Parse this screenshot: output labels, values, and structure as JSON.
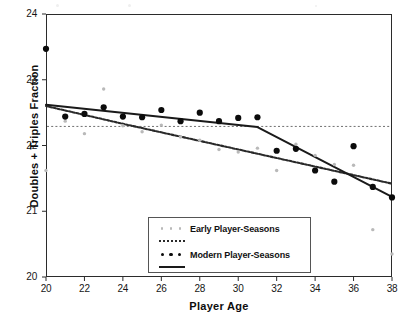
{
  "figure": {
    "background": "#ffffff",
    "frame_color": "#2b2b2b"
  },
  "axes": {
    "xlabel": "Player  Age",
    "ylabel": "Doubles  +  Triples  Fraction",
    "xlim": [
      20,
      38
    ],
    "ylim": [
      20,
      24
    ],
    "xticks": [
      20,
      22,
      24,
      26,
      28,
      30,
      32,
      34,
      36,
      38
    ],
    "yticks": [
      20,
      21,
      22,
      23,
      24
    ],
    "xtick_labels": [
      "20",
      "22",
      "24",
      "26",
      "28",
      "30",
      "32",
      "34",
      "36",
      "38"
    ],
    "ytick_labels": [
      "20",
      "21",
      "22",
      "23",
      "24"
    ],
    "grid": false
  },
  "legend": {
    "position": "lower-center-inside",
    "entries": [
      {
        "label": "Early Player-Seasons",
        "marker_color": "#b9b9b9",
        "line_style": "dotted",
        "line_color": "#2a2a2a"
      },
      {
        "label": "Modern Player-Seasons",
        "marker_color": "#0b0b0b",
        "line_style": "solid",
        "line_color": "#1a1a1a"
      }
    ]
  },
  "chart_data": {
    "type": "scatter",
    "title": "",
    "xlabel": "Player  Age",
    "ylabel": "Doubles  +  Triples  Fraction",
    "xlim": [
      20,
      38
    ],
    "ylim": [
      20,
      24
    ],
    "grid": false,
    "legend_position": "lower-center-inside",
    "series": [
      {
        "name": "Early Player-Seasons",
        "marker": "dot-small",
        "color": "#b9b9b9",
        "x": [
          20,
          21,
          22,
          23,
          24,
          25,
          26,
          27,
          28,
          29,
          30,
          31,
          32,
          33,
          34,
          35,
          36,
          37,
          38
        ],
        "y": [
          21.62,
          22.37,
          22.18,
          22.86,
          22.3,
          22.21,
          22.31,
          22.13,
          22.08,
          21.94,
          21.9,
          21.96,
          21.62,
          22.02,
          21.85,
          21.71,
          21.7,
          20.72,
          20.35
        ]
      },
      {
        "name": "Modern Player-Seasons",
        "marker": "dot-large",
        "color": "#0b0b0b",
        "x": [
          20,
          21,
          22,
          23,
          24,
          25,
          26,
          27,
          28,
          29,
          30,
          31,
          32,
          33,
          34,
          35,
          36,
          37,
          38
        ],
        "y": [
          23.47,
          22.44,
          22.48,
          22.58,
          22.44,
          22.43,
          22.54,
          22.37,
          22.5,
          22.37,
          22.42,
          22.43,
          21.92,
          21.95,
          21.62,
          21.45,
          21.99,
          21.37,
          21.21
        ]
      }
    ],
    "fit_lines": [
      {
        "name": "Early Player-Seasons fit",
        "style": "dotted",
        "color": "#2a2a2a",
        "points": [
          [
            20,
            22.6
          ],
          [
            24,
            22.33
          ],
          [
            38,
            21.42
          ]
        ]
      },
      {
        "name": "Modern Player-Seasons fit",
        "style": "solid",
        "color": "#1a1a1a",
        "points": [
          [
            20,
            22.62
          ],
          [
            31,
            22.28
          ],
          [
            38,
            21.22
          ]
        ]
      }
    ],
    "reference_lines": [
      {
        "name": "horizontal-reference",
        "orientation": "horizontal",
        "value": 22.29,
        "style": "dashed",
        "color": "#707070"
      }
    ]
  }
}
